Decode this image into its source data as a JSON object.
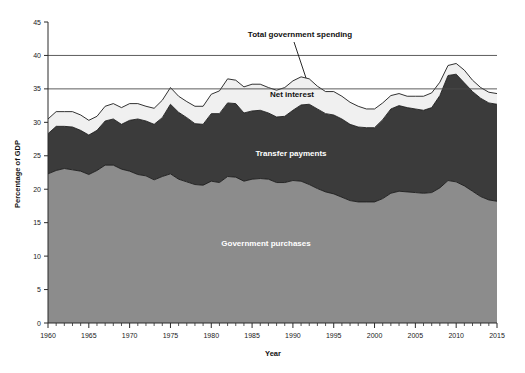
{
  "chart_data": {
    "type": "area",
    "title": "",
    "xlabel": "Year",
    "ylabel": "Percentage of GDP",
    "xlim": [
      1960,
      2015
    ],
    "ylim": [
      0,
      45
    ],
    "ytick_step": 5,
    "xtick_step": 5,
    "xtick_minor_step": 1,
    "grid": "horizontal-partial",
    "stacked": true,
    "legend_position": "inline-annotations",
    "x": [
      1960,
      1961,
      1962,
      1963,
      1964,
      1965,
      1966,
      1967,
      1968,
      1969,
      1970,
      1971,
      1972,
      1973,
      1974,
      1975,
      1976,
      1977,
      1978,
      1979,
      1980,
      1981,
      1982,
      1983,
      1984,
      1985,
      1986,
      1987,
      1988,
      1989,
      1990,
      1991,
      1992,
      1993,
      1994,
      1995,
      1996,
      1997,
      1998,
      1999,
      2000,
      2001,
      2002,
      2003,
      2004,
      2005,
      2006,
      2007,
      2008,
      2009,
      2010,
      2011,
      2012,
      2013,
      2014,
      2015
    ],
    "xticklabels": [
      "1960",
      "1965",
      "1970",
      "1975",
      "1980",
      "1985",
      "1990",
      "1995",
      "2000",
      "2005",
      "2010",
      "2015"
    ],
    "yticklabels": [
      "0",
      "5",
      "10",
      "15",
      "20",
      "25",
      "30",
      "35",
      "40",
      "45"
    ],
    "series": [
      {
        "name": "Government purchases",
        "color": "#8c8c8c",
        "label_color": "#ffffff",
        "values": [
          22.3,
          22.8,
          23.1,
          22.9,
          22.7,
          22.2,
          22.8,
          23.6,
          23.6,
          23.0,
          22.7,
          22.2,
          22.0,
          21.4,
          21.9,
          22.3,
          21.5,
          21.1,
          20.7,
          20.6,
          21.2,
          21.0,
          21.9,
          21.8,
          21.2,
          21.5,
          21.6,
          21.5,
          21.0,
          21.0,
          21.3,
          21.2,
          20.7,
          20.1,
          19.6,
          19.3,
          18.8,
          18.3,
          18.1,
          18.1,
          18.1,
          18.6,
          19.4,
          19.7,
          19.6,
          19.5,
          19.4,
          19.5,
          20.2,
          21.3,
          21.1,
          20.5,
          19.7,
          18.9,
          18.4,
          18.2
        ]
      },
      {
        "name": "Transfer payments",
        "color": "#3b3b3b",
        "label_color": "#ffffff",
        "values": [
          6.0,
          6.6,
          6.3,
          6.4,
          6.1,
          5.9,
          6.0,
          6.6,
          6.9,
          6.7,
          7.6,
          8.3,
          8.2,
          8.3,
          8.8,
          10.4,
          10.0,
          9.6,
          9.1,
          9.1,
          10.1,
          10.3,
          11.0,
          11.0,
          10.2,
          10.2,
          10.2,
          9.9,
          9.8,
          9.9,
          10.5,
          11.4,
          12.0,
          11.9,
          11.7,
          11.8,
          11.7,
          11.4,
          11.2,
          11.1,
          11.1,
          11.8,
          12.6,
          12.8,
          12.6,
          12.5,
          12.4,
          12.7,
          13.8,
          15.7,
          16.1,
          15.4,
          14.9,
          14.7,
          14.5,
          14.5
        ]
      },
      {
        "name": "Net interest",
        "color": "#f0f0f0",
        "label_color": "#111111",
        "values": [
          2.2,
          2.2,
          2.2,
          2.3,
          2.3,
          2.2,
          2.1,
          2.2,
          2.3,
          2.5,
          2.5,
          2.3,
          2.2,
          2.4,
          2.6,
          2.5,
          2.4,
          2.4,
          2.6,
          2.7,
          2.9,
          3.4,
          3.6,
          3.5,
          3.9,
          4.0,
          3.9,
          3.8,
          4.0,
          4.3,
          4.4,
          4.2,
          3.8,
          3.4,
          3.3,
          3.5,
          3.4,
          3.3,
          3.1,
          2.8,
          2.8,
          2.5,
          2.0,
          1.8,
          1.7,
          1.9,
          2.1,
          2.2,
          2.0,
          1.5,
          1.6,
          1.9,
          1.7,
          1.6,
          1.6,
          1.6
        ]
      }
    ],
    "total_label": "Total government spending",
    "totals": [
      30.5,
      31.6,
      31.6,
      31.6,
      31.1,
      30.3,
      30.9,
      32.4,
      32.8,
      32.2,
      32.8,
      32.8,
      32.4,
      32.1,
      33.3,
      35.2,
      33.9,
      33.1,
      32.4,
      32.4,
      34.2,
      34.7,
      36.5,
      36.3,
      35.3,
      35.7,
      35.7,
      35.2,
      34.8,
      35.2,
      36.2,
      36.8,
      36.5,
      35.4,
      34.6,
      34.6,
      33.9,
      33.0,
      32.4,
      32.0,
      32.0,
      32.9,
      34.0,
      34.3,
      33.9,
      33.9,
      33.9,
      34.4,
      36.0,
      38.5,
      38.8,
      37.8,
      36.3,
      35.2,
      34.5,
      34.3
    ],
    "reference_lines": [
      {
        "value": 40,
        "label": "40"
      },
      {
        "value": 35,
        "label": "35"
      }
    ],
    "annotations": [
      {
        "name": "total-government-spending",
        "text": "Total government spending",
        "x_px": 300,
        "y_px": 37
      },
      {
        "name": "net-interest",
        "text": "Net interest",
        "x_px": 292,
        "y_px": 97
      },
      {
        "name": "transfer-payments",
        "text": "Transfer payments",
        "x_px": 291,
        "y_px": 156
      },
      {
        "name": "government-purchases",
        "text": "Government purchases",
        "x_px": 266,
        "y_px": 246
      }
    ]
  }
}
